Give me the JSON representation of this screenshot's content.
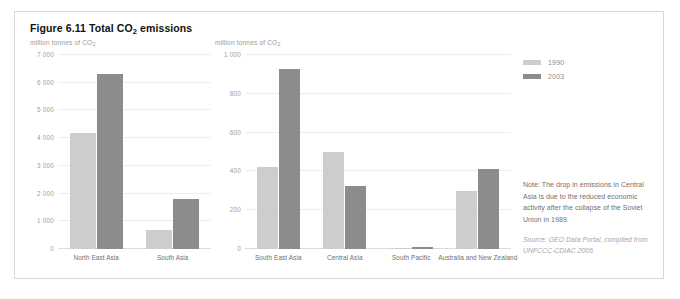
{
  "figure": {
    "title_prefix": "Figure 6.11 Total CO",
    "title_sub": "2",
    "title_suffix": " emissions",
    "title_full": "Figure 6.11 Total CO2 emissions"
  },
  "axis_caption": {
    "prefix": "million tonnes of CO",
    "sub": "2"
  },
  "legend": {
    "items": [
      {
        "label": "1990",
        "color": "#cdcdcd",
        "swatch_name": "legend-swatch-1990"
      },
      {
        "label": "2003",
        "color": "#8c8c8c",
        "swatch_name": "legend-swatch-2003"
      }
    ]
  },
  "note": {
    "text": "Note: The drop in emissions in Central Asia is due to the reduced economic activity after the collapse of the Soviet Union in 1989.",
    "source": "Source: GEO Data Portal, compiled from UNFCCC-CDIAC 2006"
  },
  "colors": {
    "series_1990": "#cdcdcd",
    "series_2003": "#8c8c8c",
    "grid": "#ededed",
    "baseline": "#dcdcdc",
    "tick_text": "#9e9e9e",
    "category_text": "#6e6e6e",
    "caption_text": "#9a9a9a",
    "note_text": "#707070",
    "source_text": "#a6a6a6",
    "frame_border": "#d8d8d8",
    "title_text": "#121212"
  },
  "chart_data": [
    {
      "id": "left",
      "type": "bar",
      "title": "Figure 6.11 Total CO2 emissions",
      "subtitle": "",
      "xlabel": "",
      "ylabel": "million tonnes of CO2",
      "ylim": [
        0,
        7000
      ],
      "yticks": [
        0,
        1000,
        2000,
        3000,
        4000,
        5000,
        6000,
        7000
      ],
      "ytick_labels": [
        "0",
        "1 000",
        "2 000",
        "3 000",
        "4 000",
        "5 000",
        "6 000",
        "7 000"
      ],
      "grid": true,
      "legend_position": "right-outside",
      "categories": [
        "North East Asia",
        "South Asia"
      ],
      "series": [
        {
          "name": "1990",
          "color": "#cdcdcd",
          "values": [
            4200,
            700
          ]
        },
        {
          "name": "2003",
          "color": "#8c8c8c",
          "values": [
            6300,
            1800
          ]
        }
      ]
    },
    {
      "id": "right",
      "type": "bar",
      "title": "",
      "subtitle": "",
      "xlabel": "",
      "ylabel": "million tonnes of CO2",
      "ylim": [
        0,
        1000
      ],
      "yticks": [
        0,
        200,
        400,
        600,
        800,
        1000
      ],
      "ytick_labels": [
        "0",
        "200",
        "400",
        "600",
        "800",
        "1 000"
      ],
      "grid": true,
      "legend_position": "right-outside",
      "categories": [
        "South East Asia",
        "Central Asia",
        "South Pacific",
        "Australia and New Zealand"
      ],
      "series": [
        {
          "name": "1990",
          "color": "#cdcdcd",
          "values": [
            425,
            500,
            5,
            300
          ]
        },
        {
          "name": "2003",
          "color": "#8c8c8c",
          "values": [
            930,
            325,
            12,
            410
          ]
        }
      ]
    }
  ]
}
